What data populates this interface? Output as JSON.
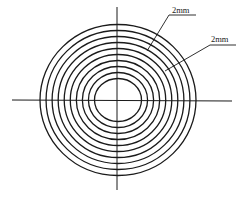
{
  "diagram": {
    "ring_count": 10,
    "ring_spacing": "2mm",
    "stroke_color": "#1a1a1a",
    "background": "#ffffff",
    "annotations": [
      {
        "id": "dim-1",
        "text": "2mm",
        "describes": "spacing between rings (upper leader)"
      },
      {
        "id": "dim-2",
        "text": "2mm",
        "describes": "spacing between rings (lower leader)"
      }
    ],
    "axes": [
      {
        "id": "horizontal-axis",
        "style": "center line"
      },
      {
        "id": "vertical-axis",
        "style": "center line"
      }
    ]
  }
}
